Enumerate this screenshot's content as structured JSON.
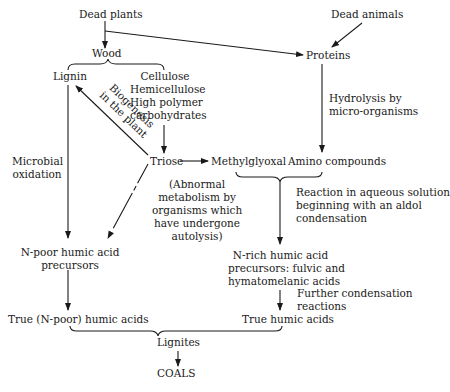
{
  "diagram": {
    "nodes": {
      "dead_plants": "Dead plants",
      "dead_animals": "Dead animals",
      "wood": "Wood",
      "proteins": "Proteins",
      "lignin": "Lignin",
      "cellulose": [
        "Cellulose",
        "Hemicellulose",
        "High polymer",
        "carbohydrates"
      ],
      "triose": "Triose",
      "methylglyoxal": "Methylglyoxal",
      "amino_compounds": "Amino compounds",
      "n_poor_precursors": [
        "N-poor humic acid",
        "precursors"
      ],
      "n_rich_precursors": [
        "N-rich humic acid",
        "precursors: fulvic and",
        "hymatomelanic acids"
      ],
      "true_n_poor_humic": "True (N-poor) humic acids",
      "true_humic": "True humic acids",
      "lignites": "Lignites",
      "coals": "COALS"
    },
    "edge_labels": {
      "biogenesis": [
        "Biogenesis",
        "in the plant"
      ],
      "microbial_oxidation": [
        "Microbial",
        "oxidation"
      ],
      "hydrolysis": [
        "Hydrolysis by",
        "micro-organisms"
      ],
      "abnormal_metabolism": [
        "(Abnormal",
        "metabolism by",
        "organisms which",
        "have undergone",
        "autolysis)"
      ],
      "aqueous_reaction": [
        "Reaction in aqueous solution",
        "beginning with an aldol",
        "condensation"
      ],
      "further_condensation": [
        "Further condensation",
        "reactions"
      ]
    },
    "colors": {
      "ink": "#1a1a1a",
      "background": "#ffffff"
    }
  }
}
